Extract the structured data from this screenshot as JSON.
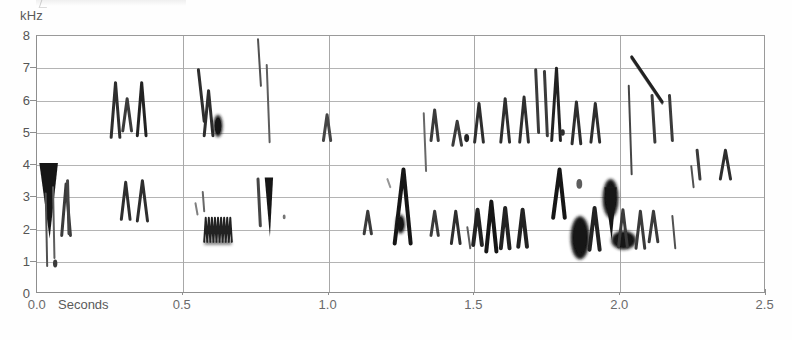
{
  "figure": {
    "unit_label": "kHz",
    "seconds_label": "Seconds",
    "background_color": "#ffffff",
    "grid_color": "#b4b4b4",
    "ink_color": "#1a1a1a"
  },
  "axes": {
    "y_ticks": [
      "8",
      "7",
      "6",
      "5",
      "4",
      "3",
      "2",
      "1",
      "0"
    ],
    "x_ticks": [
      "0.0",
      "0.5",
      "1.0",
      "1.5",
      "2.0",
      "2.5"
    ]
  },
  "chart_data": {
    "type": "heatmap",
    "title": "",
    "xlabel": "Seconds",
    "ylabel": "kHz",
    "xlim": [
      0.0,
      2.5
    ],
    "ylim": [
      0,
      8
    ],
    "x_ticks": [
      0.0,
      0.5,
      1.0,
      1.5,
      2.0,
      2.5
    ],
    "y_ticks": [
      0,
      1,
      2,
      3,
      4,
      5,
      6,
      7,
      8
    ],
    "grid": true,
    "legend": "none",
    "elements": [
      {
        "kind": "wedge",
        "t0": 0.02,
        "t1": 0.06,
        "f_hi": 4.05,
        "f_lo": 1.7,
        "intensity": 1.0,
        "w": 7,
        "note": "opening dark down-sweep 4.0->1.7 kHz"
      },
      {
        "kind": "stroke",
        "t0": 0.03,
        "t1": 0.035,
        "f_hi": 3.1,
        "f_lo": 0.85,
        "intensity": 0.75,
        "w": 2,
        "note": "thin low tail"
      },
      {
        "kind": "stroke",
        "t0": 0.055,
        "t1": 0.06,
        "f_hi": 3.3,
        "f_lo": 1.1,
        "intensity": 0.7,
        "w": 2
      },
      {
        "kind": "vee",
        "t0": 0.085,
        "t1": 0.115,
        "f_hi": 3.4,
        "f_lo": 1.8,
        "intensity": 0.85,
        "w": 3
      },
      {
        "kind": "stroke",
        "t0": 0.105,
        "t1": 0.11,
        "f_hi": 3.5,
        "f_lo": 1.85,
        "intensity": 0.8,
        "w": 3
      },
      {
        "kind": "dot",
        "t0": 0.055,
        "t1": 0.07,
        "f_hi": 1.05,
        "f_lo": 0.8,
        "intensity": 0.85,
        "w": 2
      },
      {
        "kind": "vee",
        "t0": 0.255,
        "t1": 0.285,
        "f_hi": 6.55,
        "f_lo": 4.85,
        "intensity": 0.9,
        "w": 3
      },
      {
        "kind": "vee",
        "t0": 0.295,
        "t1": 0.325,
        "f_hi": 6.05,
        "f_lo": 5.05,
        "intensity": 0.85,
        "w": 3
      },
      {
        "kind": "vee",
        "t0": 0.345,
        "t1": 0.375,
        "f_hi": 6.55,
        "f_lo": 4.9,
        "intensity": 0.95,
        "w": 3
      },
      {
        "kind": "vee",
        "t0": 0.29,
        "t1": 0.32,
        "f_hi": 3.45,
        "f_lo": 2.3,
        "intensity": 0.9,
        "w": 3
      },
      {
        "kind": "vee",
        "t0": 0.345,
        "t1": 0.38,
        "f_hi": 3.5,
        "f_lo": 2.25,
        "intensity": 0.9,
        "w": 3
      },
      {
        "kind": "stroke",
        "t0": 0.555,
        "t1": 0.575,
        "f_hi": 6.95,
        "f_lo": 5.35,
        "intensity": 0.9,
        "w": 3
      },
      {
        "kind": "vee",
        "t0": 0.575,
        "t1": 0.605,
        "f_hi": 6.3,
        "f_lo": 4.9,
        "intensity": 0.9,
        "w": 3
      },
      {
        "kind": "blob",
        "t0": 0.61,
        "t1": 0.635,
        "f_hi": 5.55,
        "f_lo": 4.85,
        "intensity": 1.0,
        "w": 9,
        "note": "round dark spot at 5 kHz"
      },
      {
        "kind": "trill",
        "t0": 0.575,
        "t1": 0.67,
        "f_hi": 2.35,
        "f_lo": 1.6,
        "intensity": 0.95,
        "w": 2,
        "cycles": 9,
        "note": "zig-zag trill near 2 kHz"
      },
      {
        "kind": "stroke",
        "t0": 0.57,
        "t1": 0.575,
        "f_hi": 3.15,
        "f_lo": 2.55,
        "intensity": 0.65,
        "w": 2
      },
      {
        "kind": "stroke",
        "t0": 0.545,
        "t1": 0.552,
        "f_hi": 2.8,
        "f_lo": 2.45,
        "intensity": 0.55,
        "w": 2
      },
      {
        "kind": "stroke",
        "t0": 0.76,
        "t1": 0.77,
        "f_hi": 7.9,
        "f_lo": 6.45,
        "intensity": 0.75,
        "w": 2
      },
      {
        "kind": "stroke",
        "t0": 0.79,
        "t1": 0.8,
        "f_hi": 7.1,
        "f_lo": 4.7,
        "intensity": 0.7,
        "w": 2
      },
      {
        "kind": "stroke",
        "t0": 0.76,
        "t1": 0.768,
        "f_hi": 3.55,
        "f_lo": 2.1,
        "intensity": 0.8,
        "w": 3
      },
      {
        "kind": "wedge",
        "t0": 0.79,
        "t1": 0.805,
        "f_hi": 3.6,
        "f_lo": 1.75,
        "intensity": 1.0,
        "w": 4
      },
      {
        "kind": "dot",
        "t0": 0.845,
        "t1": 0.855,
        "f_hi": 2.45,
        "f_lo": 2.3,
        "intensity": 0.6,
        "w": 2
      },
      {
        "kind": "vee",
        "t0": 0.985,
        "t1": 1.01,
        "f_hi": 5.55,
        "f_lo": 4.75,
        "intensity": 0.8,
        "w": 3
      },
      {
        "kind": "vee",
        "t0": 1.125,
        "t1": 1.15,
        "f_hi": 2.55,
        "f_lo": 1.85,
        "intensity": 0.85,
        "w": 3
      },
      {
        "kind": "stroke",
        "t0": 1.205,
        "t1": 1.215,
        "f_hi": 3.55,
        "f_lo": 3.3,
        "intensity": 0.45,
        "w": 2
      },
      {
        "kind": "peak",
        "t0": 1.23,
        "t1": 1.285,
        "f_hi": 3.85,
        "f_lo": 1.55,
        "intensity": 1.0,
        "w": 4,
        "note": "inverted-V upsweep/downsweep"
      },
      {
        "kind": "blob",
        "t0": 1.235,
        "t1": 1.265,
        "f_hi": 2.45,
        "f_lo": 1.85,
        "intensity": 1.0,
        "w": 9
      },
      {
        "kind": "stroke",
        "t0": 1.33,
        "t1": 1.338,
        "f_hi": 5.6,
        "f_lo": 3.8,
        "intensity": 0.65,
        "w": 2
      },
      {
        "kind": "vee",
        "t0": 1.355,
        "t1": 1.38,
        "f_hi": 5.7,
        "f_lo": 4.75,
        "intensity": 0.85,
        "w": 3
      },
      {
        "kind": "vee",
        "t0": 1.355,
        "t1": 1.38,
        "f_hi": 2.55,
        "f_lo": 1.8,
        "intensity": 0.85,
        "w": 3
      },
      {
        "kind": "vee",
        "t0": 1.43,
        "t1": 1.46,
        "f_hi": 5.35,
        "f_lo": 4.6,
        "intensity": 0.85,
        "w": 3
      },
      {
        "kind": "vee",
        "t0": 1.425,
        "t1": 1.455,
        "f_hi": 2.55,
        "f_lo": 1.55,
        "intensity": 0.9,
        "w": 3
      },
      {
        "kind": "dot",
        "t0": 1.47,
        "t1": 1.485,
        "f_hi": 4.95,
        "f_lo": 4.7,
        "intensity": 0.95,
        "w": 5
      },
      {
        "kind": "stroke",
        "t0": 1.48,
        "t1": 1.49,
        "f_hi": 2.05,
        "f_lo": 1.4,
        "intensity": 0.7,
        "w": 2
      },
      {
        "kind": "vee",
        "t0": 1.505,
        "t1": 1.535,
        "f_hi": 5.9,
        "f_lo": 4.7,
        "intensity": 0.9,
        "w": 3
      },
      {
        "kind": "vee",
        "t0": 1.5,
        "t1": 1.53,
        "f_hi": 2.6,
        "f_lo": 1.5,
        "intensity": 0.95,
        "w": 4
      },
      {
        "kind": "vee",
        "t0": 1.545,
        "t1": 1.58,
        "f_hi": 2.85,
        "f_lo": 1.3,
        "intensity": 1.0,
        "w": 4
      },
      {
        "kind": "vee",
        "t0": 1.595,
        "t1": 1.625,
        "f_hi": 6.05,
        "f_lo": 4.7,
        "intensity": 0.9,
        "w": 3
      },
      {
        "kind": "vee",
        "t0": 1.595,
        "t1": 1.625,
        "f_hi": 2.65,
        "f_lo": 1.4,
        "intensity": 0.95,
        "w": 4
      },
      {
        "kind": "vee",
        "t0": 1.66,
        "t1": 1.69,
        "f_hi": 6.1,
        "f_lo": 4.7,
        "intensity": 0.9,
        "w": 3
      },
      {
        "kind": "vee",
        "t0": 1.655,
        "t1": 1.685,
        "f_hi": 2.6,
        "f_lo": 1.45,
        "intensity": 0.95,
        "w": 4
      },
      {
        "kind": "stroke",
        "t0": 1.715,
        "t1": 1.725,
        "f_hi": 6.95,
        "f_lo": 5.0,
        "intensity": 0.85,
        "w": 3
      },
      {
        "kind": "stroke",
        "t0": 1.745,
        "t1": 1.755,
        "f_hi": 6.9,
        "f_lo": 4.9,
        "intensity": 0.85,
        "w": 3
      },
      {
        "kind": "peak",
        "t0": 1.77,
        "t1": 1.8,
        "f_hi": 7.0,
        "f_lo": 4.75,
        "intensity": 0.95,
        "w": 3
      },
      {
        "kind": "peak",
        "t0": 1.775,
        "t1": 1.815,
        "f_hi": 3.85,
        "f_lo": 2.35,
        "intensity": 1.0,
        "w": 4
      },
      {
        "kind": "dot",
        "t0": 1.8,
        "t1": 1.815,
        "f_hi": 5.1,
        "f_lo": 4.9,
        "intensity": 0.9,
        "w": 4
      },
      {
        "kind": "vee",
        "t0": 1.84,
        "t1": 1.87,
        "f_hi": 5.95,
        "f_lo": 4.65,
        "intensity": 0.9,
        "w": 3
      },
      {
        "kind": "blob",
        "t0": 1.835,
        "t1": 1.9,
        "f_hi": 2.4,
        "f_lo": 1.05,
        "intensity": 1.0,
        "w": 14,
        "note": "very dark dense burst"
      },
      {
        "kind": "dot",
        "t0": 1.855,
        "t1": 1.875,
        "f_hi": 3.55,
        "f_lo": 3.25,
        "intensity": 0.7,
        "w": 4
      },
      {
        "kind": "vee",
        "t0": 1.905,
        "t1": 1.935,
        "f_hi": 5.9,
        "f_lo": 4.7,
        "intensity": 0.9,
        "w": 3
      },
      {
        "kind": "vee",
        "t0": 1.9,
        "t1": 1.935,
        "f_hi": 2.65,
        "f_lo": 1.35,
        "intensity": 0.95,
        "w": 4
      },
      {
        "kind": "blob",
        "t0": 1.945,
        "t1": 2.0,
        "f_hi": 3.55,
        "f_lo": 2.35,
        "intensity": 1.0,
        "w": 12
      },
      {
        "kind": "wedge",
        "t0": 1.96,
        "t1": 1.985,
        "f_hi": 3.3,
        "f_lo": 1.65,
        "intensity": 1.0,
        "w": 5
      },
      {
        "kind": "blob",
        "t0": 1.975,
        "t1": 2.06,
        "f_hi": 1.95,
        "f_lo": 1.35,
        "intensity": 1.0,
        "w": 11,
        "note": "horizontal dark bar near 1.7 kHz"
      },
      {
        "kind": "sweep",
        "t0": 2.045,
        "t1": 2.15,
        "f_hi": 7.35,
        "f_lo": 5.95,
        "intensity": 0.95,
        "w": 3,
        "note": "long descending sweep 7.3 -> 6.0 kHz"
      },
      {
        "kind": "stroke",
        "t0": 2.035,
        "t1": 2.045,
        "f_hi": 6.45,
        "f_lo": 3.7,
        "intensity": 0.8,
        "w": 2
      },
      {
        "kind": "vee",
        "t0": 2.0,
        "t1": 2.03,
        "f_hi": 2.6,
        "f_lo": 1.45,
        "intensity": 0.85,
        "w": 3
      },
      {
        "kind": "vee",
        "t0": 2.06,
        "t1": 2.09,
        "f_hi": 2.55,
        "f_lo": 1.4,
        "intensity": 0.85,
        "w": 3
      },
      {
        "kind": "stroke",
        "t0": 2.115,
        "t1": 2.125,
        "f_hi": 6.15,
        "f_lo": 4.7,
        "intensity": 0.85,
        "w": 3
      },
      {
        "kind": "vee",
        "t0": 2.105,
        "t1": 2.135,
        "f_hi": 2.55,
        "f_lo": 1.6,
        "intensity": 0.85,
        "w": 3
      },
      {
        "kind": "stroke",
        "t0": 2.175,
        "t1": 2.185,
        "f_hi": 6.15,
        "f_lo": 4.75,
        "intensity": 0.85,
        "w": 3
      },
      {
        "kind": "stroke",
        "t0": 2.185,
        "t1": 2.195,
        "f_hi": 2.4,
        "f_lo": 1.4,
        "intensity": 0.75,
        "w": 2
      },
      {
        "kind": "stroke",
        "t0": 2.27,
        "t1": 2.28,
        "f_hi": 4.45,
        "f_lo": 3.55,
        "intensity": 0.85,
        "w": 3
      },
      {
        "kind": "stroke",
        "t0": 2.25,
        "t1": 2.258,
        "f_hi": 3.95,
        "f_lo": 3.3,
        "intensity": 0.75,
        "w": 2
      },
      {
        "kind": "vee",
        "t0": 2.35,
        "t1": 2.385,
        "f_hi": 4.45,
        "f_lo": 3.55,
        "intensity": 0.9,
        "w": 3
      }
    ]
  }
}
